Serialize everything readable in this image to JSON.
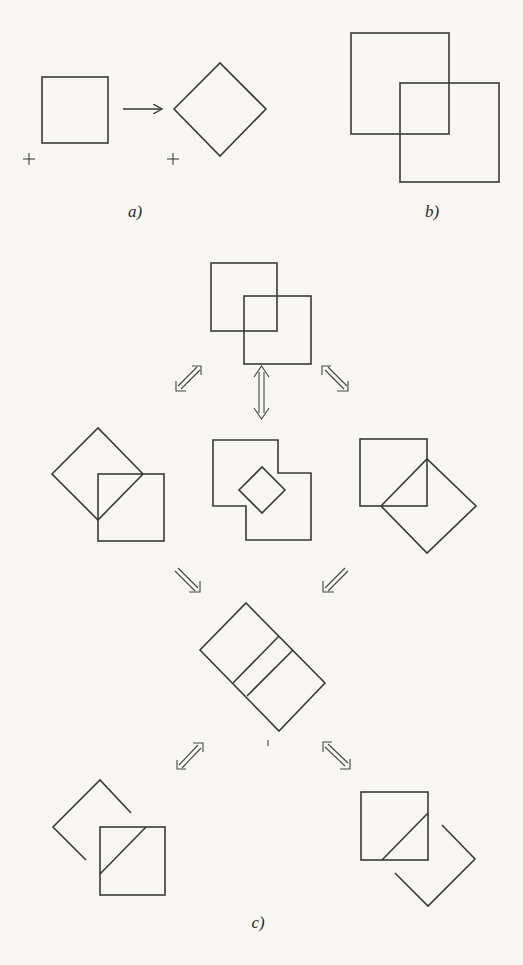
{
  "figure": {
    "panels": [
      {
        "id": "a",
        "label": "a)",
        "description": "Square rotated 45 degrees about a pivot point (+)"
      },
      {
        "id": "b",
        "label": "b)",
        "description": "Two overlapping squares"
      },
      {
        "id": "c",
        "label": "c)",
        "description": "Transformation graph of overlapping square configurations"
      }
    ],
    "colors": {
      "background": "#f7f6f2",
      "stroke": "#3a3a3a"
    },
    "symbols": {
      "pivot_marker": "+",
      "transform_arrow": "→"
    }
  }
}
